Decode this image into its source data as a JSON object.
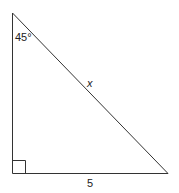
{
  "diagram": {
    "type": "right-triangle",
    "angle_label": "45°",
    "hypotenuse_label": "x",
    "base_label": "5",
    "right_angle_marker": true,
    "stroke_color": "#333333"
  }
}
